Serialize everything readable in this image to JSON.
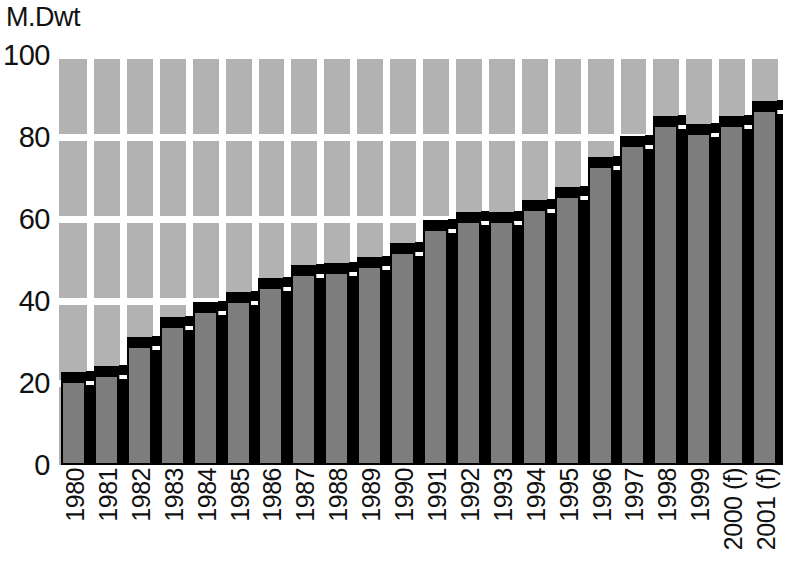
{
  "chart_data": {
    "type": "bar",
    "title": "",
    "subtitle": "",
    "xlabel": "",
    "ylabel": "M.Dwt",
    "unit_label": "M.Dwt",
    "categories": [
      "1980",
      "1981",
      "1982",
      "1983",
      "1984",
      "1985",
      "1986",
      "1987",
      "1988",
      "1989",
      "1990",
      "1991",
      "1992",
      "1993",
      "1994",
      "1995",
      "1996",
      "1997",
      "1998",
      "1999",
      "2000 (f)",
      "2001 (f)"
    ],
    "values": [
      20.5,
      22.0,
      29.0,
      34.0,
      37.5,
      40.0,
      43.5,
      46.5,
      47.0,
      48.5,
      52.0,
      57.5,
      59.5,
      59.5,
      62.5,
      65.5,
      73.0,
      78.0,
      83.0,
      81.0,
      83.0,
      86.5
    ],
    "ylim": [
      0,
      100
    ],
    "yticks": [
      0,
      20,
      40,
      60,
      80,
      100
    ],
    "ytick_labels": [
      "0",
      "20",
      "40",
      "60",
      "80",
      "100"
    ],
    "grid": true,
    "grid_color": "#ffffff",
    "legend": null,
    "legend_position": "none",
    "plot_background": "#b2b2b2",
    "bar_color": "#7d7d7d",
    "bar_edge_color": "#000000",
    "bar_style": "3d-extruded",
    "annotations": [
      "(f) denotes forecast values for 2000 and 2001"
    ]
  },
  "colors": {
    "plot_background": "#b2b2b2",
    "gridline": "#ffffff",
    "bar_fill": "#7d7d7d",
    "bar_shadow": "#000000",
    "text": "#111111",
    "page_background": "#ffffff"
  }
}
